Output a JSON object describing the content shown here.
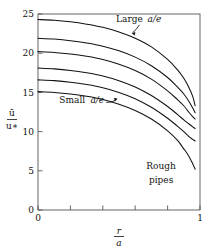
{
  "chart_data": {
    "type": "line",
    "title": "",
    "subtitle": "",
    "xlabel": "r/a",
    "xlabel_num": "r",
    "xlabel_den": "a",
    "ylabel": "ū/u∗",
    "ylabel_num": "ū",
    "ylabel_den": "u∗",
    "xlim": [
      0,
      1
    ],
    "ylim": [
      0,
      25
    ],
    "xticks": [
      0,
      0.2,
      0.4,
      0.6,
      0.8,
      1
    ],
    "xtick_labels": [
      "0",
      "",
      "",
      "",
      "",
      "1"
    ],
    "yticks": [
      0,
      5,
      10,
      15,
      20,
      25
    ],
    "ytick_labels": [
      "0",
      "5",
      "10",
      "15",
      "20",
      "25"
    ],
    "grid": false,
    "legend": "none",
    "line_color": "#111111",
    "frame_color": "#555555",
    "annotations": [
      {
        "name": "large-ae",
        "text": "Large",
        "math": "a/e",
        "x": 0.62,
        "y": 24.0
      },
      {
        "name": "small-ae",
        "text": "Small",
        "math": "a/e",
        "x": 0.23,
        "y": 13.6
      },
      {
        "name": "rough-pipes-line1",
        "text": "Rough",
        "x": 0.76,
        "y": 5.2
      },
      {
        "name": "rough-pipes-line2",
        "text": "pipes",
        "x": 0.76,
        "y": 3.4
      }
    ],
    "x": [
      0,
      0.1,
      0.2,
      0.3,
      0.4,
      0.5,
      0.6,
      0.7,
      0.8,
      0.86,
      0.9,
      0.93,
      0.955,
      0.97
    ],
    "series": [
      {
        "name": "curve-1-largest-a-over-e",
        "values": [
          24.3,
          24.2,
          24.0,
          23.7,
          23.3,
          22.7,
          21.9,
          20.8,
          19.2,
          17.9,
          16.8,
          15.7,
          14.5,
          13.3
        ]
      },
      {
        "name": "curve-2",
        "values": [
          21.9,
          21.8,
          21.6,
          21.3,
          20.9,
          20.3,
          19.5,
          18.4,
          16.9,
          15.7,
          14.8,
          13.9,
          13.0,
          12.4
        ]
      },
      {
        "name": "curve-3",
        "values": [
          20.2,
          20.1,
          19.9,
          19.6,
          19.2,
          18.6,
          17.8,
          16.7,
          15.2,
          14.1,
          13.3,
          12.5,
          11.9,
          11.6
        ]
      },
      {
        "name": "curve-4",
        "values": [
          18.1,
          18.0,
          17.8,
          17.5,
          17.1,
          16.5,
          15.7,
          14.6,
          13.2,
          12.2,
          11.5,
          11.0,
          10.6,
          10.4
        ]
      },
      {
        "name": "curve-5",
        "values": [
          16.6,
          16.5,
          16.3,
          16.0,
          15.6,
          15.0,
          14.2,
          13.1,
          11.7,
          10.7,
          10.0,
          9.4,
          9.0,
          8.8
        ]
      },
      {
        "name": "curve-6-smallest-a-over-e",
        "values": [
          15.1,
          15.0,
          14.8,
          14.5,
          14.1,
          13.5,
          12.7,
          11.6,
          10.1,
          8.9,
          7.8,
          6.9,
          5.9,
          5.2
        ]
      }
    ]
  },
  "figure": {
    "plot_left": 38,
    "plot_right": 200,
    "plot_top": 14,
    "plot_bottom": 210
  }
}
